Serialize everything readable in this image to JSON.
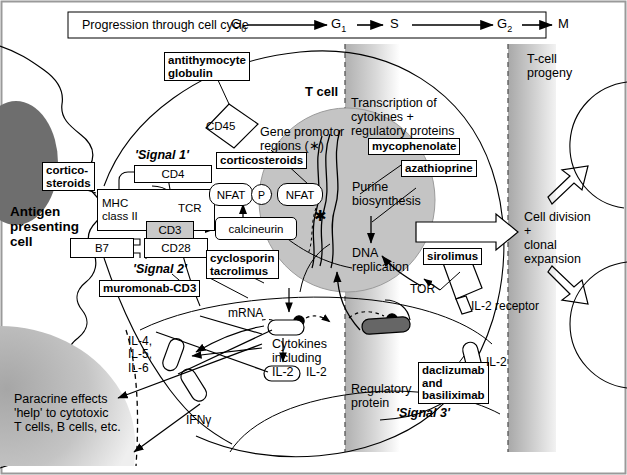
{
  "figure": {
    "domain_type": "biomedical-pathway-diagram"
  },
  "cellcycle": {
    "caption": "Progression through cell cycle",
    "phases": [
      "G",
      "G",
      "S",
      "G",
      "M"
    ],
    "phase_labels": [
      "G0",
      "G1",
      "S",
      "G2",
      "M"
    ],
    "subs": [
      "0",
      "1",
      "",
      "2",
      ""
    ]
  },
  "cells": {
    "apc": "Antigen\npresenting\ncell",
    "tcell": "T cell",
    "progeny": "T-cell\nprogeny"
  },
  "signals": {
    "one": "'Signal 1'",
    "two": "'Signal 2'",
    "three": "'Signal 3'"
  },
  "receptors": {
    "cd45": "CD45",
    "cd4": "CD4",
    "mhc": "MHC\nclass II",
    "tcr": "TCR",
    "cd3": "CD3",
    "b7": "B7",
    "cd28": "CD28",
    "il2r": "IL-2 receptor"
  },
  "drugs": {
    "antithymocyte_globulin": "antithymocyte\nglobulin",
    "corticosteroids_apc": "cortico-\nsteroids",
    "corticosteroids_gene": "corticosteroids",
    "muromonab": "muromonab-CD3",
    "cyclosporin_tacrolimus": "cyclosporin\ntacrolimus",
    "mycophenolate": "mycophenolate",
    "azathioprine": "azathioprine",
    "sirolimus": "sirolimus",
    "daclizumab_basiliximab": "daclizumab\nand\nbasiliximab"
  },
  "molecules": {
    "nfat_p": "NFAT",
    "nfat_active": "NFAT",
    "phospho": "P",
    "calcineurin": "calcineurin",
    "tor": "TOR",
    "mrna": "mRNA",
    "il2": "IL-2",
    "ifng": "IFNγ",
    "interleukins": "IL-4,\nIL-5,\nIL-6"
  },
  "processes": {
    "gene_promotor": "Gene promotor\nregions (∗)",
    "transcription": "Transcription of\ncytokines +\nregulatory proteins",
    "purine": "Purine\nbiosynthesis",
    "dna_replication": "DNA\nreplication",
    "cytokines_incl": "Cytokines\nincluding\nIL-2",
    "regulatory_protein": "Regulatory\nprotein",
    "cell_division": "Cell division\n+\nclonal\nexpansion",
    "paracrine": "Paracrine effects\n'help' to cytotoxic\nT cells, B cells, etc."
  },
  "colors": {
    "ink": "#000000",
    "nucleus_fill": "#c4c4c4",
    "apc_nucleus": "#6e6e6e",
    "receptor_shade": "#c9c9c9",
    "regulatory_protein": "#666666",
    "band_gradient_top": "#b4b4b4",
    "paracrine_fill": "#b8b8b8",
    "frame": "#9a9a9a"
  }
}
